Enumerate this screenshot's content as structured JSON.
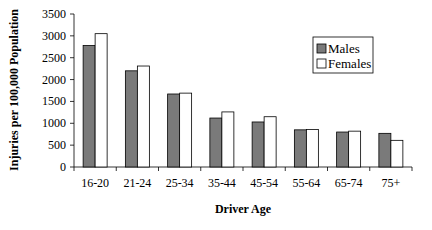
{
  "chart_data": {
    "type": "bar",
    "title": "",
    "xlabel": "Driver Age",
    "ylabel": "Injuries per 100,000 Population",
    "categories": [
      "16-20",
      "21-24",
      "25-34",
      "35-44",
      "45-54",
      "55-64",
      "65-74",
      "75+"
    ],
    "series": [
      {
        "name": "Males",
        "color": "#7a7a7a",
        "values": [
          2780,
          2200,
          1670,
          1120,
          1030,
          850,
          800,
          770
        ]
      },
      {
        "name": "Females",
        "color": "#ffffff",
        "values": [
          3050,
          2310,
          1690,
          1260,
          1150,
          860,
          820,
          610
        ]
      }
    ],
    "ylim": [
      0,
      3500
    ],
    "yticks": [
      0,
      500,
      1000,
      1500,
      2000,
      2500,
      3000,
      3500
    ],
    "grid": false,
    "legend_position": "upper right"
  }
}
